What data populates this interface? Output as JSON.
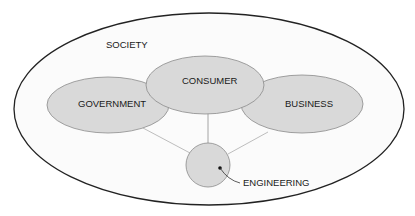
{
  "diagram": {
    "type": "nested-venn",
    "colors": {
      "background": "#ffffff",
      "outer_fill": "#fbfbfb",
      "outer_stroke": "#222222",
      "node_fill": "#d9d9d9",
      "node_stroke": "#8a8a8a",
      "connector": "#b5b5b5",
      "text": "#1a1a1a"
    },
    "outer": {
      "label": "SOCIETY"
    },
    "nodes": [
      {
        "id": "consumer",
        "label": "CONSUMER"
      },
      {
        "id": "government",
        "label": "GOVERNMENT"
      },
      {
        "id": "business",
        "label": "BUSINESS"
      },
      {
        "id": "engineering",
        "label": "ENGINEERING"
      }
    ],
    "connections": [
      {
        "from": "engineering",
        "to": "government"
      },
      {
        "from": "engineering",
        "to": "consumer"
      },
      {
        "from": "engineering",
        "to": "business"
      }
    ]
  }
}
